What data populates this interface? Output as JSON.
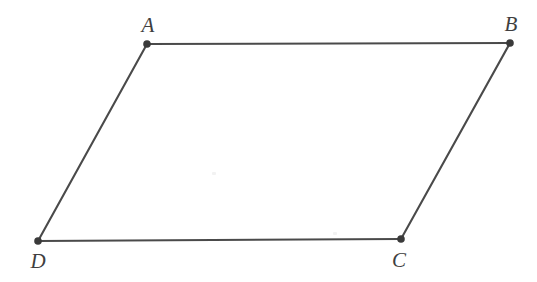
{
  "figure": {
    "kind": "geometry-diagram",
    "shape_name": "parallelogram",
    "background_color": "#ffffff",
    "line_color": "#4a4a4a",
    "line_width": 2.1,
    "dot_color": "#3a3a3a",
    "dot_radius": 3.8,
    "label_color": "#3f3f3f",
    "canvas": {
      "width": 537,
      "height": 282
    }
  },
  "vertices": [
    {
      "id": "A",
      "label": "A",
      "x": 147,
      "y": 44,
      "label_x": 148,
      "label_y": 25
    },
    {
      "id": "B",
      "label": "B",
      "x": 510,
      "y": 43,
      "label_x": 511,
      "label_y": 24
    },
    {
      "id": "C",
      "label": "C",
      "x": 401,
      "y": 239,
      "label_x": 399,
      "label_y": 260
    },
    {
      "id": "D",
      "label": "D",
      "x": 38,
      "y": 241,
      "label_x": 38,
      "label_y": 261
    }
  ],
  "edges": [
    {
      "id": "AB",
      "from": "A",
      "to": "B",
      "x1": 147,
      "y1": 44,
      "x2": 510,
      "y2": 43
    },
    {
      "id": "BC",
      "from": "B",
      "to": "C",
      "x1": 510,
      "y1": 43,
      "x2": 401,
      "y2": 239
    },
    {
      "id": "CD",
      "from": "C",
      "to": "D",
      "x1": 401,
      "y1": 239,
      "x2": 38,
      "y2": 241
    },
    {
      "id": "DA",
      "from": "D",
      "to": "A",
      "x1": 38,
      "y1": 241,
      "x2": 147,
      "y2": 44
    }
  ],
  "artifacts": [
    {
      "id": "speck-1",
      "x": 212,
      "y": 172
    },
    {
      "id": "speck-2",
      "x": 333,
      "y": 232
    }
  ]
}
